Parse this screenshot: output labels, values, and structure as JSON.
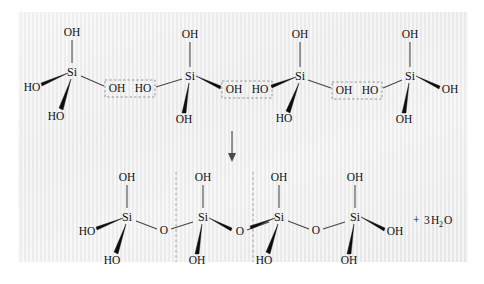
{
  "figure": {
    "kind": "chemical-reaction-scheme",
    "background_color": "#ececec",
    "bond_color": "#444444",
    "atom_color": "#111111",
    "dash_color": "#8d8d8d"
  },
  "labels": {
    "hydroxyl": "OH",
    "hydroxyl_reversed": "HO",
    "silicon": "Si",
    "oxygen": "O"
  },
  "reactants": {
    "row_label": "four silicic acid units",
    "units": [
      {
        "id": "reactant-si-1",
        "center": "Si",
        "top": "OH",
        "left": "HO",
        "bottom": "HO",
        "right": "OH"
      },
      {
        "id": "reactant-si-2",
        "center": "Si",
        "top": "OH",
        "left": "HO",
        "bottom": "OH",
        "right": "OH"
      },
      {
        "id": "reactant-si-3",
        "center": "Si",
        "top": "OH",
        "left": "HO",
        "bottom": "HO",
        "right": "OH"
      },
      {
        "id": "reactant-si-4",
        "center": "Si",
        "top": "OH",
        "left": "HO",
        "bottom": "OH",
        "right": "OH"
      }
    ],
    "leaving_groups": [
      {
        "id": "leaving-pair-1",
        "left": "OH",
        "right": "HO"
      },
      {
        "id": "leaving-pair-2",
        "left": "OH",
        "right": "HO"
      },
      {
        "id": "leaving-pair-3",
        "left": "OH",
        "right": "HO"
      }
    ]
  },
  "arrow": {
    "direction": "down",
    "label": ""
  },
  "products": {
    "row_label": "siloxane chain",
    "units": [
      {
        "id": "product-si-1",
        "center": "Si",
        "top": "OH",
        "left": "HO",
        "bottom": "HO",
        "right": ""
      },
      {
        "id": "product-si-2",
        "center": "Si",
        "top": "OH",
        "left": "",
        "bottom": "OH",
        "right": ""
      },
      {
        "id": "product-si-3",
        "center": "Si",
        "top": "OH",
        "left": "",
        "bottom": "HO",
        "right": ""
      },
      {
        "id": "product-si-4",
        "center": "Si",
        "top": "OH",
        "left": "",
        "bottom": "OH",
        "right": "OH"
      }
    ],
    "bridges": [
      {
        "id": "bridge-o-1",
        "atom": "O"
      },
      {
        "id": "bridge-o-2",
        "atom": "O"
      },
      {
        "id": "bridge-o-3",
        "atom": "O"
      }
    ],
    "repeat_dividers": 2,
    "byproduct": {
      "plus": "+",
      "coefficient": "3",
      "formula_head": "H",
      "formula_sub": "2",
      "formula_tail": "O",
      "text": "+ 3H2O"
    }
  }
}
